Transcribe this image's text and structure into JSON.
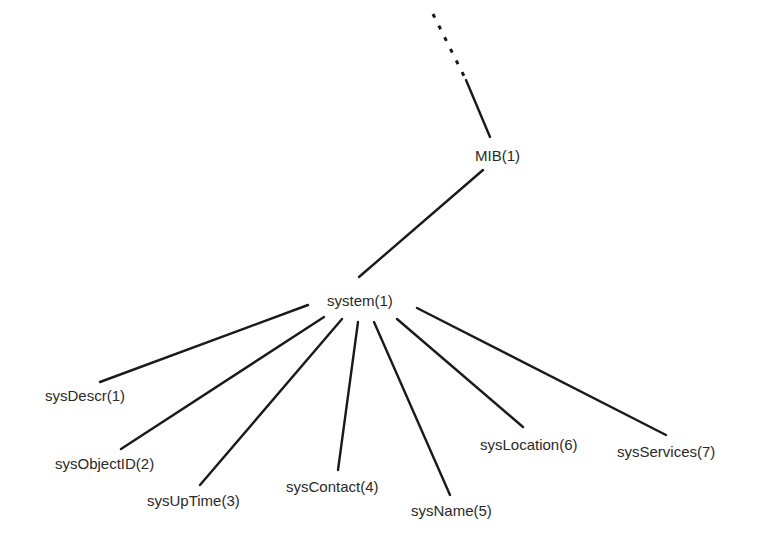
{
  "diagram": {
    "type": "tree",
    "parent_ellipsis": {
      "x1": 433,
      "y1": 14,
      "x2": 466,
      "y2": 80
    },
    "root_link": {
      "x1": 466,
      "y1": 80,
      "x2": 490,
      "y2": 137
    },
    "nodes": {
      "mib": {
        "label": "MIB(1)",
        "x": 475,
        "y": 161
      },
      "system": {
        "label": "system(1)",
        "x": 327,
        "y": 306
      },
      "children": [
        {
          "label": "sysDescr(1)",
          "x": 45,
          "y": 401,
          "edge": [
            308,
            305,
            100,
            382
          ]
        },
        {
          "label": "sysObjectID(2)",
          "x": 55,
          "y": 469,
          "edge": [
            324,
            317,
            121,
            449
          ]
        },
        {
          "label": "sysUpTime(3)",
          "x": 147,
          "y": 506,
          "edge": [
            342,
            319,
            200,
            485
          ]
        },
        {
          "label": "sysContact(4)",
          "x": 286,
          "y": 492,
          "edge": [
            358,
            322,
            338,
            470
          ]
        },
        {
          "label": "sysName(5)",
          "x": 411,
          "y": 516,
          "edge": [
            374,
            322,
            450,
            495
          ]
        },
        {
          "label": "sysLocation(6)",
          "x": 480,
          "y": 450,
          "edge": [
            397,
            319,
            523,
            427
          ]
        },
        {
          "label": "sysServices(7)",
          "x": 617,
          "y": 457,
          "edge": [
            417,
            308,
            666,
            435
          ]
        }
      ]
    },
    "mib_to_system_edge": [
      483,
      170,
      359,
      277
    ]
  }
}
